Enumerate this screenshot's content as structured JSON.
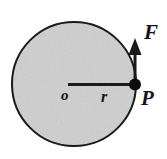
{
  "figure": {
    "background_color": "#ffffff",
    "disc": {
      "name": "disc",
      "fill_color": "#d2d2d2",
      "stroke_color": "#1a1a1a",
      "center_x": 74,
      "center_y": 84,
      "radius": 63,
      "stroke_width": 2
    },
    "radius_line": {
      "name": "radius-line",
      "from_x": 68,
      "from_y": 84,
      "to_x": 135,
      "to_y": 84,
      "color": "#1a1a1a",
      "stroke_width": 3
    },
    "point_marker": {
      "name": "point-p-dot",
      "x": 135,
      "y": 84,
      "radius": 6,
      "color": "#0d0d0d"
    },
    "force_arrow": {
      "name": "force-arrow",
      "from_x": 135,
      "from_y": 84,
      "to_x": 135,
      "to_y": 39,
      "color": "#1a1a1a",
      "stroke_width": 3,
      "head_width": 13,
      "head_length": 14
    },
    "labels": {
      "force": "F",
      "point": "P",
      "center": "o",
      "radius": "r"
    }
  }
}
